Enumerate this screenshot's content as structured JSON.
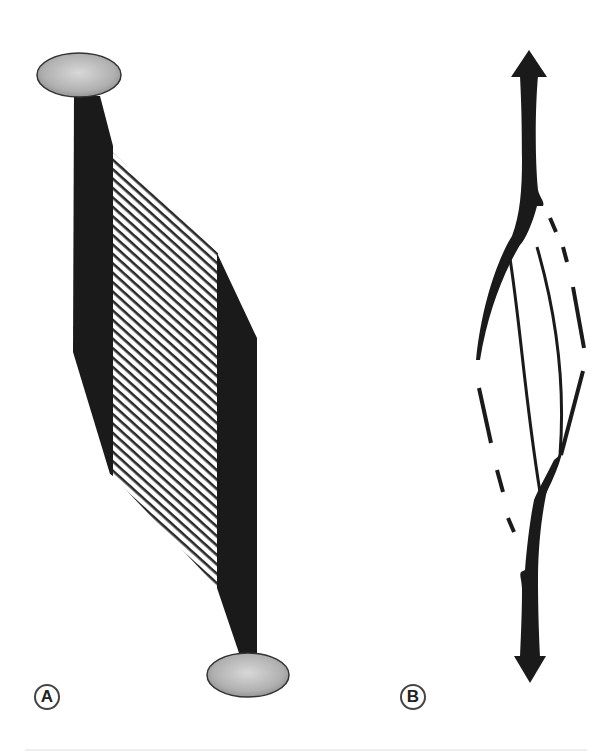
{
  "figure": {
    "colors": {
      "tendon": "#1a1a1a",
      "bone": "#b5b5b5",
      "bone_stroke": "#333333",
      "fibers": "#2a2a2a",
      "background": "#ffffff"
    }
  },
  "panels": [
    {
      "id": "A",
      "label": "A",
      "content": "pennate-muscle"
    },
    {
      "id": "B",
      "label": "B",
      "content": "fusiform-muscle-with-arrows"
    }
  ]
}
